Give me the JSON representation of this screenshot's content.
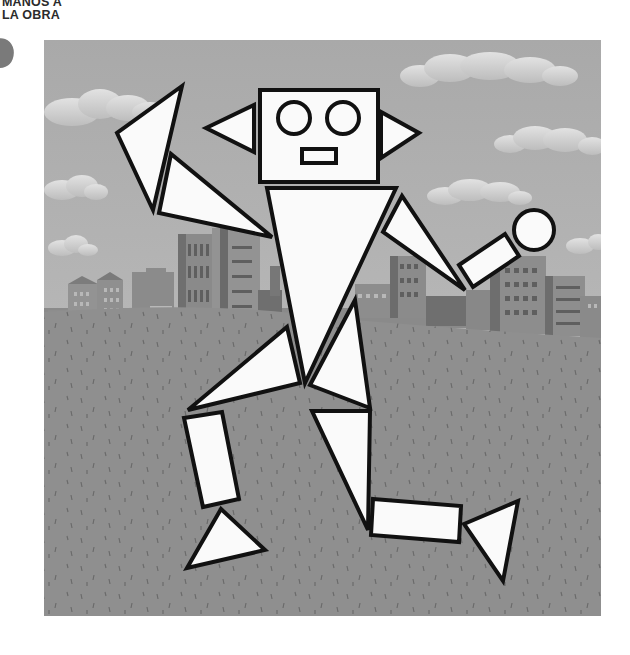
{
  "header": {
    "line1": "MANOS A",
    "line2": "LA OBRA"
  },
  "illustration": {
    "subject": "robot made of geometric shapes",
    "background": "city skyline with clouds and grassy field",
    "colors": {
      "sky": "#b4b4b4",
      "cloud": "#d2d2d2",
      "building_dark": "#6e6e6e",
      "building_mid": "#8a8a8a",
      "building_light": "#9a9a9a",
      "ground": "#8f8f8f",
      "shape_fill": "#fafafa",
      "outline": "#111111"
    },
    "shapes": [
      {
        "part": "head",
        "type": "rectangle"
      },
      {
        "part": "left-eye",
        "type": "circle"
      },
      {
        "part": "right-eye",
        "type": "circle"
      },
      {
        "part": "mouth",
        "type": "rectangle"
      },
      {
        "part": "left-ear",
        "type": "triangle"
      },
      {
        "part": "right-ear",
        "type": "triangle"
      },
      {
        "part": "body",
        "type": "triangle"
      },
      {
        "part": "left-hand",
        "type": "triangle"
      },
      {
        "part": "left-arm",
        "type": "triangle"
      },
      {
        "part": "right-arm",
        "type": "triangle"
      },
      {
        "part": "right-forearm",
        "type": "rectangle"
      },
      {
        "part": "right-hand",
        "type": "circle"
      },
      {
        "part": "left-thigh",
        "type": "triangle"
      },
      {
        "part": "right-thigh",
        "type": "triangle"
      },
      {
        "part": "left-shin",
        "type": "rectangle"
      },
      {
        "part": "left-foot",
        "type": "triangle"
      },
      {
        "part": "right-leg",
        "type": "triangle"
      },
      {
        "part": "right-shin",
        "type": "rectangle"
      },
      {
        "part": "right-foot",
        "type": "triangle"
      }
    ]
  }
}
